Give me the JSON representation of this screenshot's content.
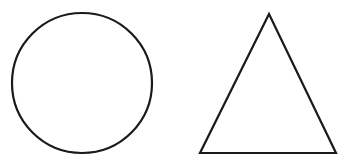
{
  "shapes": [
    {
      "type": "circle",
      "cx": 82,
      "cy": 83,
      "r": 70,
      "stroke": "#1a1a1a",
      "fill": "none",
      "stroke_width": 2.2
    },
    {
      "type": "triangle",
      "points": [
        [
          269,
          14
        ],
        [
          200,
          153
        ],
        [
          336,
          153
        ]
      ],
      "stroke": "#1a1a1a",
      "fill": "none",
      "stroke_width": 2.2
    }
  ],
  "background": "#ffffff"
}
